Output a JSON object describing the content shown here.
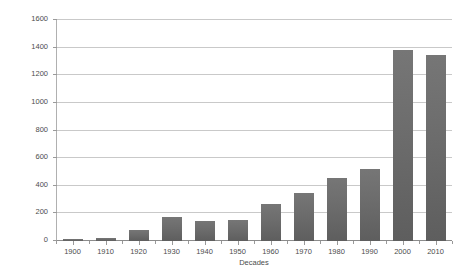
{
  "chart_data": {
    "type": "bar",
    "title": "",
    "xlabel": "Decades",
    "ylabel": "Publications",
    "categories": [
      "1900",
      "1910",
      "1920",
      "1930",
      "1940",
      "1950",
      "1960",
      "1970",
      "1980",
      "1990",
      "2000",
      "2010"
    ],
    "values": [
      12,
      25,
      80,
      175,
      145,
      155,
      265,
      345,
      455,
      520,
      1385,
      1350
    ],
    "ylim": [
      0,
      1600
    ],
    "yticks": [
      0,
      200,
      400,
      600,
      800,
      1000,
      1200,
      1400,
      1600
    ],
    "ytick_labels": [
      "0",
      "200",
      "400",
      "600",
      "800",
      "1000",
      "1200",
      "1400",
      "1600"
    ],
    "grid": true,
    "legend": false,
    "legend_position": "none",
    "bar_color": "#6b6b6b",
    "gridline_color": "#c9c9c9",
    "axis_color": "#8c8c8c",
    "text_color": "#4c4c4c",
    "background_color": "#ffffff"
  }
}
